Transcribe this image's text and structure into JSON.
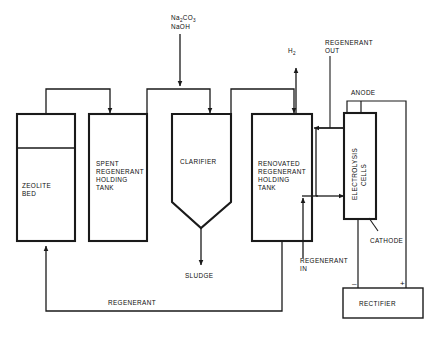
{
  "diagram": {
    "type": "process-flow-diagram",
    "stroke_color": "#1a1a1a",
    "background_color": "#ffffff"
  },
  "chemicals": {
    "line1_prefix": "Na",
    "line1_sub1": "2",
    "line1_mid": "CO",
    "line1_sub2": "3",
    "line2": "NaOH"
  },
  "vessels": [
    {
      "id": "zeolite-bed",
      "label_lines": [
        "ZEOLITE",
        "BED"
      ]
    },
    {
      "id": "spent-regenerant-tank",
      "label_lines": [
        "SPENT",
        "REGENERANT",
        "HOLDING",
        "TANK"
      ]
    },
    {
      "id": "clarifier",
      "label_lines": [
        "CLARIFIER"
      ]
    },
    {
      "id": "renovated-regenerant-tank",
      "label_lines": [
        "RENOVATED",
        "REGENERANT",
        "HOLDING",
        "TANK"
      ]
    },
    {
      "id": "electrolysis-cells",
      "label_lines": [
        "ELECTROLYSIS",
        "CELLS"
      ]
    },
    {
      "id": "rectifier",
      "label_lines": [
        "RECTIFIER"
      ]
    }
  ],
  "stream_labels": {
    "hydrogen_prefix": "H",
    "hydrogen_sub": "2",
    "regenerant_out_line1": "REGENERANT",
    "regenerant_out_line2": "OUT",
    "regenerant_in_line1": "REGENERANT",
    "regenerant_in_line2": "IN",
    "sludge": "SLUDGE",
    "regenerant_return": "REGENERANT"
  },
  "electrode_labels": {
    "anode": "ANODE",
    "cathode": "CATHODE",
    "negative_terminal": "–",
    "positive_terminal": "+"
  }
}
